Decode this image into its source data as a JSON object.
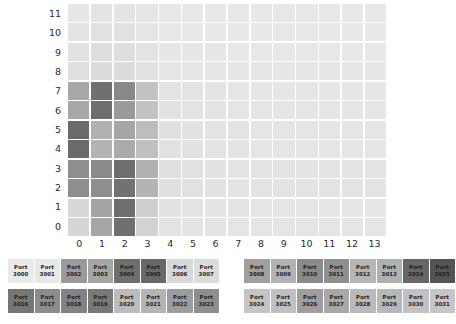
{
  "chart_data": {
    "type": "heatmap",
    "title": "",
    "xlabel": "",
    "ylabel": "",
    "x_tick_labels": [
      "0",
      "1",
      "2",
      "3",
      "4",
      "5",
      "6",
      "7",
      "8",
      "9",
      "10",
      "11",
      "12",
      "13"
    ],
    "y_tick_labels": [
      "11",
      "10",
      "9",
      "8",
      "7",
      "6",
      "5",
      "4",
      "3",
      "2",
      "1",
      "0"
    ],
    "xlim": [
      0,
      13
    ],
    "ylim": [
      0,
      11
    ],
    "grid": true,
    "legend_position": "below-plot",
    "colormap": "greys",
    "background_color": "#e8e8e8",
    "gridline_color": "#ffffff",
    "note": "rows listed top (y=11) to bottom (y=0); each row has 14 values for x=0..13",
    "values": [
      [
        "#e7e7e7",
        "#e4e4e4",
        "#e4e4e4",
        "#e6e6e6",
        "#e8e8e8",
        "#e8e8e8",
        "#e8e8e8",
        "#e8e8e8",
        "#e8e8e8",
        "#e8e8e8",
        "#e8e8e8",
        "#e8e8e8",
        "#e8e8e8",
        "#e8e8e8"
      ],
      [
        "#e4e4e4",
        "#e1e1e1",
        "#e1e1e1",
        "#e5e5e5",
        "#e8e8e8",
        "#e8e8e8",
        "#e8e8e8",
        "#e8e8e8",
        "#e8e8e8",
        "#e8e8e8",
        "#e8e8e8",
        "#e8e8e8",
        "#e8e8e8",
        "#e8e8e8"
      ],
      [
        "#e2e2e2",
        "#dedede",
        "#dedede",
        "#e3e3e3",
        "#e7e7e7",
        "#e7e7e7",
        "#e7e7e7",
        "#e8e8e8",
        "#e8e8e8",
        "#e8e8e8",
        "#e8e8e8",
        "#e8e8e8",
        "#e8e8e8",
        "#e8e8e8"
      ],
      [
        "#e0e0e0",
        "#dcdcdc",
        "#dcdcdc",
        "#e2e2e2",
        "#e6e6e6",
        "#e6e6e6",
        "#e6e6e6",
        "#e7e7e7",
        "#e7e7e7",
        "#e7e7e7",
        "#e7e7e7",
        "#e7e7e7",
        "#e7e7e7",
        "#e7e7e7"
      ],
      [
        "#a8a8a8",
        "#707070",
        "#888888",
        "#c2c2c2",
        "#e3e3e3",
        "#e3e3e3",
        "#e4e4e4",
        "#e5e5e5",
        "#e6e6e6",
        "#e6e6e6",
        "#e6e6e6",
        "#e6e6e6",
        "#e6e6e6",
        "#e6e6e6"
      ],
      [
        "#a8a8a8",
        "#6e6e6e",
        "#9a9a9a",
        "#c2c2c2",
        "#e2e2e2",
        "#e3e3e3",
        "#e4e4e4",
        "#e5e5e5",
        "#e5e5e5",
        "#e6e6e6",
        "#e6e6e6",
        "#e6e6e6",
        "#e6e6e6",
        "#e6e6e6"
      ],
      [
        "#6a6a6a",
        "#b0b0b0",
        "#a6a6a6",
        "#bdbdbd",
        "#e0e0e0",
        "#e2e2e2",
        "#e3e3e3",
        "#e4e4e4",
        "#e5e5e5",
        "#e5e5e5",
        "#e5e5e5",
        "#e5e5e5",
        "#e5e5e5",
        "#e5e5e5"
      ],
      [
        "#6a6a6a",
        "#b4b4b4",
        "#aaaaaa",
        "#c0c0c0",
        "#e1e1e1",
        "#e2e2e2",
        "#e3e3e3",
        "#e4e4e4",
        "#e5e5e5",
        "#e5e5e5",
        "#e5e5e5",
        "#e5e5e5",
        "#e5e5e5",
        "#e5e5e5"
      ],
      [
        "#8e8e8e",
        "#8a8a8a",
        "#6e6e6e",
        "#b0b0b0",
        "#dfdfdf",
        "#e1e1e1",
        "#e2e2e2",
        "#e3e3e3",
        "#e4e4e4",
        "#e4e4e4",
        "#e4e4e4",
        "#e4e4e4",
        "#e4e4e4",
        "#e4e4e4"
      ],
      [
        "#8e8e8e",
        "#8e8e8e",
        "#727272",
        "#b4b4b4",
        "#e0e0e0",
        "#e1e1e1",
        "#e2e2e2",
        "#e3e3e3",
        "#e4e4e4",
        "#e4e4e4",
        "#e4e4e4",
        "#e4e4e4",
        "#e4e4e4",
        "#e4e4e4"
      ],
      [
        "#d8d8d8",
        "#a4a4a4",
        "#6e6e6e",
        "#cfcfcf",
        "#e2e2e2",
        "#e3e3e3",
        "#e4e4e4",
        "#e4e4e4",
        "#e5e5e5",
        "#e5e5e5",
        "#e5e5e5",
        "#e5e5e5",
        "#e5e5e5",
        "#e5e5e5"
      ],
      [
        "#d6d6d6",
        "#a6a6a6",
        "#707070",
        "#d2d2d2",
        "#e3e3e3",
        "#e4e4e4",
        "#e4e4e4",
        "#e5e5e5",
        "#e5e5e5",
        "#e5e5e5",
        "#e5e5e5",
        "#e5e5e5",
        "#e5e5e5",
        "#e5e5e5"
      ]
    ]
  },
  "legend": {
    "rows": [
      {
        "groups": [
          {
            "chips": [
              {
                "line1": "Port",
                "line2": "3000",
                "color": "#eaeaea"
              },
              {
                "line1": "Port",
                "line2": "3001",
                "color": "#e8e8e8"
              },
              {
                "line1": "Port",
                "line2": "3002",
                "color": "#9a9a9a"
              },
              {
                "line1": "Port",
                "line2": "3003",
                "color": "#a6a6a6"
              },
              {
                "line1": "Port",
                "line2": "3004",
                "color": "#6e6e6e"
              },
              {
                "line1": "Port",
                "line2": "3005",
                "color": "#686868"
              },
              {
                "line1": "Port",
                "line2": "3006",
                "color": "#d8d8d8"
              },
              {
                "line1": "Port",
                "line2": "3007",
                "color": "#dcdcdc"
              }
            ]
          },
          {
            "chips": [
              {
                "line1": "Port",
                "line2": "3008",
                "color": "#a0a0a0"
              },
              {
                "line1": "Port",
                "line2": "3009",
                "color": "#b2b2b2"
              },
              {
                "line1": "Port",
                "line2": "3010",
                "color": "#8a8a8a"
              },
              {
                "line1": "Port",
                "line2": "3011",
                "color": "#909090"
              },
              {
                "line1": "Port",
                "line2": "3012",
                "color": "#b6b6b6"
              },
              {
                "line1": "Port",
                "line2": "3013",
                "color": "#b0b0b0"
              },
              {
                "line1": "Port",
                "line2": "3014",
                "color": "#666666"
              },
              {
                "line1": "Port",
                "line2": "3015",
                "color": "#545454"
              }
            ]
          }
        ]
      },
      {
        "groups": [
          {
            "chips": [
              {
                "line1": "Port",
                "line2": "3016",
                "color": "#767676"
              },
              {
                "line1": "Port",
                "line2": "3017",
                "color": "#8c8c8c"
              },
              {
                "line1": "Port",
                "line2": "3018",
                "color": "#828282"
              },
              {
                "line1": "Port",
                "line2": "3019",
                "color": "#787878"
              },
              {
                "line1": "Port",
                "line2": "3020",
                "color": "#bcbcbc"
              },
              {
                "line1": "Port",
                "line2": "3021",
                "color": "#b4b4b4"
              },
              {
                "line1": "Port",
                "line2": "3022",
                "color": "#9c9c9c"
              },
              {
                "line1": "Port",
                "line2": "3023",
                "color": "#8e8e8e"
              }
            ]
          },
          {
            "chips": [
              {
                "line1": "Port",
                "line2": "3024",
                "color": "#c4c4c4"
              },
              {
                "line1": "Port",
                "line2": "3025",
                "color": "#c0c0c0"
              },
              {
                "line1": "Port",
                "line2": "3026",
                "color": "#9e9e9e"
              },
              {
                "line1": "Port",
                "line2": "3027",
                "color": "#a8a8a8"
              },
              {
                "line1": "Port",
                "line2": "3028",
                "color": "#bababa"
              },
              {
                "line1": "Port",
                "line2": "3029",
                "color": "#b8b8b8"
              },
              {
                "line1": "Port",
                "line2": "3030",
                "color": "#c2c2c2"
              },
              {
                "line1": "Port",
                "line2": "3031",
                "color": "#c6c6c6"
              }
            ]
          }
        ]
      }
    ]
  }
}
